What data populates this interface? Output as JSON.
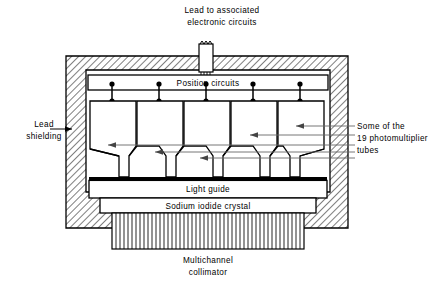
{
  "figure": {
    "kind": "technical-cross-section-diagram",
    "background_color": "#ffffff",
    "line_color": "#000000",
    "hatch_color": "#000000",
    "leader_color": "#555555"
  },
  "labels": {
    "lead_to_circuits": {
      "line1": "Lead to associated",
      "line2": "electronic circuits"
    },
    "position_circuits": "Position circuits",
    "lead_shielding": {
      "line1": "Lead",
      "line2": "shielding"
    },
    "photomultiplier": {
      "line1": "Some of the",
      "line2": "19 photomultiplier",
      "line3": "tubes"
    },
    "light_guide": "Light guide",
    "sodium_iodide_crystal": "Sodium iodide crystal",
    "collimator": {
      "line1": "Multichannel",
      "line2": "collimator"
    }
  },
  "components": {
    "photomultiplier_tube_count_drawn": 5,
    "position_circuit_nodes": 5,
    "collimator_channel_lines": 45,
    "leader_arrow_count_right": 4,
    "leader_arrow_count_left": 1
  },
  "geometry": {
    "shield_outer": {
      "x": 66,
      "y": 56,
      "w": 282,
      "h": 172
    },
    "shield_inner": {
      "x": 86,
      "y": 70,
      "w": 244,
      "h": 128
    },
    "position_bar": {
      "x": 88,
      "y": 75,
      "w": 240,
      "h": 15
    },
    "light_guide": {
      "x": 89,
      "y": 180,
      "w": 238,
      "h": 18
    },
    "crystal": {
      "x": 100,
      "y": 198,
      "w": 216,
      "h": 15
    },
    "collimator": {
      "x": 112,
      "y": 213,
      "w": 192,
      "h": 36
    },
    "lead_post": {
      "x": 199,
      "y": 44,
      "w": 14,
      "h": 28
    }
  }
}
